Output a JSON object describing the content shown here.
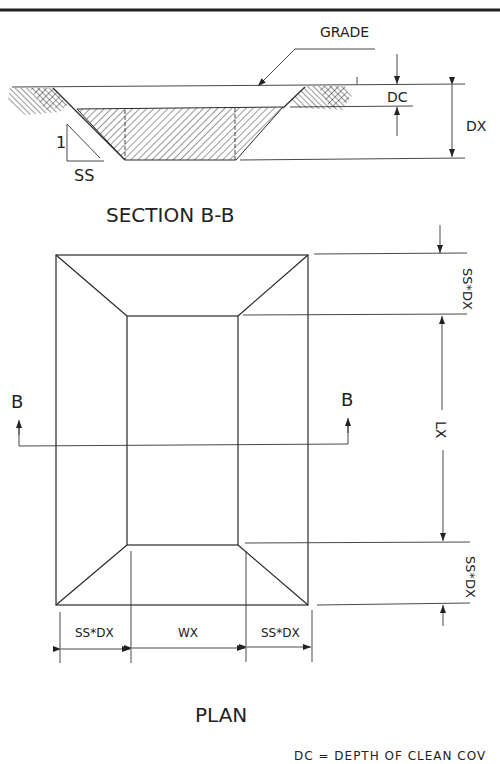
{
  "drawing": {
    "section": {
      "title": "SECTION B-B",
      "grade_label": "GRADE",
      "dc_label": "DC",
      "dx_label": "DX",
      "slope_rise": "1",
      "slope_run": "SS"
    },
    "plan": {
      "title": "PLAN",
      "cut_marker_left": "B",
      "cut_marker_right": "B",
      "dim_top_right": "SS*DX",
      "dim_length": "LX",
      "dim_bottom_right": "SS*DX",
      "dim_bottom_left": "SS*DX",
      "dim_width": "WX",
      "dim_bottom_right_horizontal": "SS*DX"
    },
    "note": "DC = DEPTH OF CLEAN COV"
  }
}
